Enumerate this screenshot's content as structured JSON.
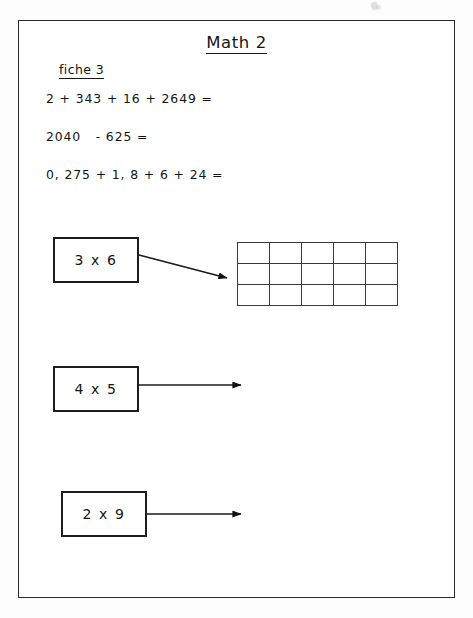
{
  "document": {
    "title": "Math 2",
    "sheet_label": "fiche 3",
    "exercises": [
      {
        "id": "addition-1",
        "text": "2 + 343 + 16 + 2649 ="
      },
      {
        "id": "subtraction-1",
        "text": "2040   - 625 ="
      },
      {
        "id": "decimal-addition-1",
        "text": "0, 275 + 1, 8 + 6 + 24 ="
      }
    ],
    "multiplication_tasks": [
      {
        "id": "task-3x6",
        "label": "3 x 6",
        "arrow": "diagonal-down-right",
        "target": "answer-grid"
      },
      {
        "id": "task-4x5",
        "label": "4 x 5",
        "arrow": "horizontal-right",
        "target": "blank-space"
      },
      {
        "id": "task-2x9",
        "label": "2 x 9",
        "arrow": "horizontal-right",
        "target": "blank-space"
      }
    ],
    "answer_grid": {
      "columns": 5,
      "rows": 3,
      "cells": [
        [
          "",
          "",
          "",
          "",
          ""
        ],
        [
          "",
          "",
          "",
          "",
          ""
        ],
        [
          "",
          "",
          "",
          "",
          ""
        ]
      ]
    },
    "colors": {
      "ink": "#151515",
      "border": "#2b2b2b",
      "grid_line": "#3a3a3a",
      "paper": "#ffffff"
    }
  }
}
